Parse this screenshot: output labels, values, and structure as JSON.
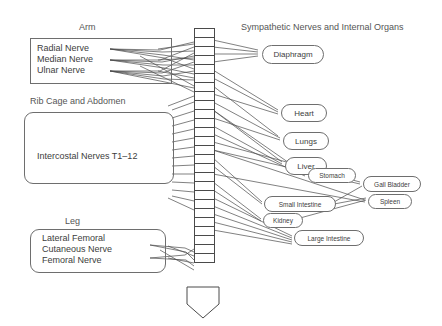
{
  "diagram": {
    "title_left": "Arm",
    "title_right": "Sympathetic Nerves and Internal Organs",
    "sections": [
      {
        "id": "arm",
        "heading": "Arm",
        "type": "rect",
        "nerves": [
          "Radial Nerve",
          "Median Nerve",
          "Ulnar Nerve"
        ]
      },
      {
        "id": "ribcage",
        "heading": "Rib Cage and Abdomen",
        "type": "round",
        "nerves": [
          "Intercostal Nerves T1–12"
        ]
      },
      {
        "id": "leg",
        "heading": "Leg",
        "type": "round",
        "nerves": [
          "Lateral Femoral",
          "Cutaneous Nerve",
          "Femoral Nerve"
        ]
      }
    ],
    "organs": [
      {
        "label": "Diaphragm",
        "size": "md",
        "x": 262,
        "y": 45,
        "w": 60,
        "h": 17
      },
      {
        "label": "Heart",
        "size": "md",
        "x": 281,
        "y": 104,
        "w": 44,
        "h": 16
      },
      {
        "label": "Lungs",
        "size": "md",
        "x": 283,
        "y": 132,
        "w": 44,
        "h": 16
      },
      {
        "label": "Liver",
        "size": "md",
        "x": 285,
        "y": 157,
        "w": 40,
        "h": 16
      },
      {
        "label": "Stomach",
        "size": "sm",
        "x": 308,
        "y": 168,
        "w": 46,
        "h": 13
      },
      {
        "label": "Gall Bladder",
        "size": "sm",
        "x": 363,
        "y": 176,
        "w": 56,
        "h": 14
      },
      {
        "label": "Small Intestine",
        "size": "sm",
        "x": 264,
        "y": 196,
        "w": 70,
        "h": 14
      },
      {
        "label": "Spleen",
        "size": "sm",
        "x": 368,
        "y": 194,
        "w": 42,
        "h": 13
      },
      {
        "label": "Kidney",
        "size": "sm",
        "x": 263,
        "y": 213,
        "w": 38,
        "h": 13
      },
      {
        "label": "Large Intestine",
        "size": "sm",
        "x": 294,
        "y": 230,
        "w": 68,
        "h": 14
      }
    ],
    "spine": {
      "label": "vertebral-column",
      "segment_count": 26,
      "x": 194,
      "top": 28,
      "seg_w": 19,
      "seg_h": 9,
      "sacrum": {
        "x": 186,
        "y": 286,
        "w": 34,
        "h": 33
      }
    },
    "colors": {
      "ink": "#3d3d3d",
      "heading": "#555555",
      "stroke": "#6e6e6e",
      "wire": "#4a4a4a",
      "background": "#ffffff"
    }
  }
}
